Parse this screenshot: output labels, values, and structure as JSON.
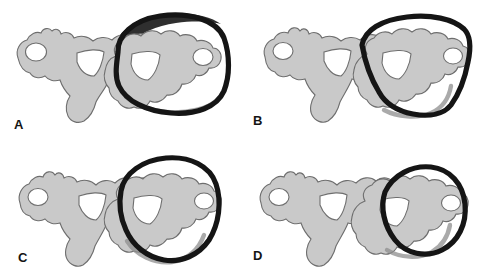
{
  "figure": {
    "background_color": "#ffffff",
    "width": 478,
    "height": 279,
    "panel_count": 4
  },
  "colors": {
    "bone_fill": "#c9c9c9",
    "bone_outline": "#6e6e6e",
    "hole_fill": "#ffffff",
    "trace_dark": "#151515",
    "trace_shadow": "#8d8d8d",
    "label_color": "#141414",
    "background": "#ffffff"
  },
  "panels": [
    {
      "id": "panel-a",
      "label": "A",
      "trace_shape": "rounded-rectangle",
      "trace_description": "Thick dark rounded-square contour traced around the right vertebral body, with a dark filled wedge at upper-left and a gray shadow band along the lower edge",
      "anatomy": "axial lumbar vertebra pair, gray filled bone with white foramen openings",
      "trace_weight": "heavy",
      "position": {
        "row": 1,
        "column": 1
      }
    },
    {
      "id": "panel-b",
      "label": "B",
      "trace_shape": "angular-shield",
      "trace_description": "Thick dark angular pear / shield contour following the vertebral body margins closely with straight lower-left and lower-right facets",
      "anatomy": "axial lumbar vertebra pair, gray filled bone with white foramen openings",
      "trace_weight": "heavy",
      "position": {
        "row": 1,
        "column": 2
      }
    },
    {
      "id": "panel-c",
      "label": "C",
      "trace_shape": "teardrop-egg",
      "trace_description": "Thick dark teardrop / egg-shaped contour, broad at the top and tapering toward the lower right, with a gray shadow band along the lower border",
      "anatomy": "axial lumbar vertebra pair, gray filled bone with white foramen openings",
      "trace_weight": "heavy",
      "position": {
        "row": 2,
        "column": 1
      }
    },
    {
      "id": "panel-d",
      "label": "D",
      "trace_shape": "small-oval",
      "trace_description": "Thick dark oval contour, narrower than the others, cutting across the middle of the right vertebra",
      "anatomy": "axial lumbar vertebra pair, gray filled bone with white foramen openings",
      "trace_weight": "heavy",
      "position": {
        "row": 2,
        "column": 2
      }
    }
  ]
}
